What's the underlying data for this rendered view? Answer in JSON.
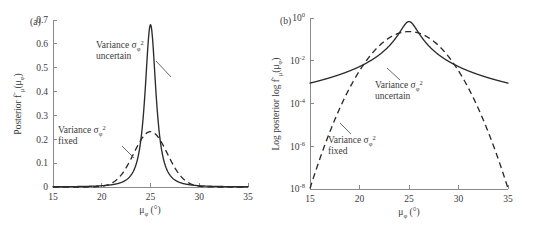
{
  "figure": {
    "background": "#ffffff",
    "axis_color": "#8a8a8a",
    "curve_color": "#2b2b2b"
  },
  "panels": [
    {
      "tag": "(a)",
      "name": "panel-a",
      "xlabel_main": "μ",
      "xlabel_sub": "φ",
      "xlabel_unit": "(°)",
      "ylabel_text": "Posterior f",
      "ylabel_prime": "″",
      "ylabel_sub": "μ",
      "ylabel_arg": "(μ",
      "ylabel_arg_sub": "φ",
      "ylabel_close": ")",
      "yticks": [
        "0",
        "0.1",
        "0.2",
        "0.3",
        "0.4",
        "0.5",
        "0.6",
        "0.7"
      ],
      "xticks": [
        "15",
        "20",
        "25",
        "30",
        "35"
      ],
      "annotations": [
        {
          "name": "annotation-uncertain",
          "line1_a": "Variance σ",
          "line1_sub": "φ",
          "line1_sup": "2",
          "line2": "uncertain"
        },
        {
          "name": "annotation-fixed",
          "line1_a": "Variance σ",
          "line1_sub": "φ",
          "line1_sup": "2",
          "line2": "fixed"
        }
      ]
    },
    {
      "tag": "(b)",
      "name": "panel-b",
      "xlabel_main": "μ",
      "xlabel_sub": "φ",
      "xlabel_unit": "(°)",
      "ylabel_text": "Log posterior log f",
      "ylabel_prime": "″",
      "ylabel_sub": "μ",
      "ylabel_arg": "(μ",
      "ylabel_arg_sub": "φ",
      "ylabel_close": ")",
      "yticks": [
        "10",
        "10",
        "10",
        "10",
        "10"
      ],
      "yticks_exp": [
        "0",
        "-2",
        "-4",
        "-6",
        "-8"
      ],
      "xticks": [
        "15",
        "20",
        "25",
        "30",
        "35"
      ],
      "annotations": [
        {
          "name": "annotation-uncertain",
          "line1_a": "Variance σ",
          "line1_sub": "φ",
          "line1_sup": "2",
          "line2": "uncertain"
        },
        {
          "name": "annotation-fixed",
          "line1_a": "Variance σ",
          "line1_sub": "φ",
          "line1_sup": "2",
          "line2": "fixed"
        }
      ]
    }
  ],
  "chart_data": [
    {
      "type": "line",
      "panel": "(a)",
      "title": "",
      "xlabel": "μ_φ (°)",
      "ylabel": "Posterior f″_μ(μ_φ)",
      "xlim": [
        15,
        35
      ],
      "ylim": [
        0,
        0.7
      ],
      "xticks": [
        15,
        20,
        25,
        30,
        35
      ],
      "yticks": [
        0,
        0.1,
        0.2,
        0.3,
        0.4,
        0.5,
        0.6,
        0.7
      ],
      "grid": false,
      "legend": "annotations",
      "series": [
        {
          "name": "Variance σ_φ² uncertain",
          "style": "solid",
          "peak_x": 25,
          "peak_y": 0.68,
          "x": [
            15,
            16,
            17,
            18,
            19,
            20,
            21,
            21.5,
            22,
            22.5,
            23,
            23.5,
            24,
            24.25,
            24.5,
            24.75,
            25,
            25.25,
            25.5,
            25.75,
            26,
            26.5,
            27,
            27.5,
            28,
            28.5,
            29,
            30,
            31,
            32,
            33,
            34,
            35
          ],
          "y": [
            0.0008,
            0.0011,
            0.0016,
            0.0024,
            0.0039,
            0.0068,
            0.0139,
            0.0216,
            0.0362,
            0.0655,
            0.1281,
            0.2529,
            0.4627,
            0.5684,
            0.6441,
            0.6753,
            0.68,
            0.6753,
            0.6441,
            0.5684,
            0.4627,
            0.2529,
            0.1281,
            0.0655,
            0.0362,
            0.0216,
            0.0139,
            0.0068,
            0.0039,
            0.0024,
            0.0016,
            0.0011,
            0.0008
          ]
        },
        {
          "name": "Variance σ_φ² fixed",
          "style": "dashed",
          "peak_x": 25,
          "peak_y": 0.232,
          "x": [
            15,
            16,
            17,
            18,
            19,
            20,
            21,
            22,
            23,
            23.5,
            24,
            24.5,
            25,
            25.5,
            26,
            26.5,
            27,
            28,
            29,
            30,
            31,
            32,
            33,
            34,
            35
          ],
          "y": [
            0.0,
            0.0,
            0.0,
            0.0001,
            0.0009,
            0.005,
            0.0201,
            0.06,
            0.1322,
            0.171,
            0.2009,
            0.22,
            0.232,
            0.22,
            0.2009,
            0.171,
            0.1322,
            0.06,
            0.0201,
            0.005,
            0.0009,
            0.0001,
            0.0,
            0.0,
            0.0
          ]
        }
      ]
    },
    {
      "type": "line",
      "panel": "(b)",
      "title": "",
      "xlabel": "μ_φ (°)",
      "ylabel": "Log posterior log f″_μ(μ_φ)",
      "xlim": [
        15,
        35
      ],
      "ylim": [
        1e-08,
        1
      ],
      "yscale": "log",
      "xticks": [
        15,
        20,
        25,
        30,
        35
      ],
      "yticks": [
        1,
        0.01,
        0.0001,
        1e-06,
        1e-08
      ],
      "ytick_labels": [
        "10^0",
        "10^-2",
        "10^-4",
        "10^-6",
        "10^-8"
      ],
      "grid": false,
      "legend": "annotations",
      "series": [
        {
          "name": "Variance σ_φ² uncertain",
          "style": "solid",
          "peak_x": 25,
          "peak_y": 0.68,
          "x": [
            15,
            16,
            17,
            18,
            19,
            20,
            21,
            22,
            23,
            24,
            25,
            26,
            27,
            28,
            29,
            30,
            31,
            32,
            33,
            34,
            35
          ],
          "y": [
            0.0008,
            0.0011,
            0.0016,
            0.0024,
            0.0039,
            0.0068,
            0.0139,
            0.0362,
            0.1281,
            0.4627,
            0.68,
            0.4627,
            0.1281,
            0.0362,
            0.0139,
            0.0068,
            0.0039,
            0.0024,
            0.0016,
            0.0011,
            0.0008
          ]
        },
        {
          "name": "Variance σ_φ² fixed",
          "style": "dashed",
          "peak_x": 25,
          "peak_y": 0.232,
          "x": [
            15,
            16,
            17,
            18,
            19,
            20,
            21,
            22,
            23,
            24,
            25,
            26,
            27,
            28,
            29,
            30,
            31,
            32,
            33,
            34,
            35
          ],
          "y": [
            1e-08,
            5.4e-07,
            1.9e-05,
            0.00043,
            0.0063,
            0.059,
            0.201,
            0.06,
            0.1322,
            0.2009,
            0.232,
            0.2009,
            0.1322,
            0.06,
            0.0201,
            0.0059,
            0.00063,
            4.3e-05,
            1.9e-06,
            5.4e-08,
            1e-08
          ]
        }
      ]
    }
  ]
}
